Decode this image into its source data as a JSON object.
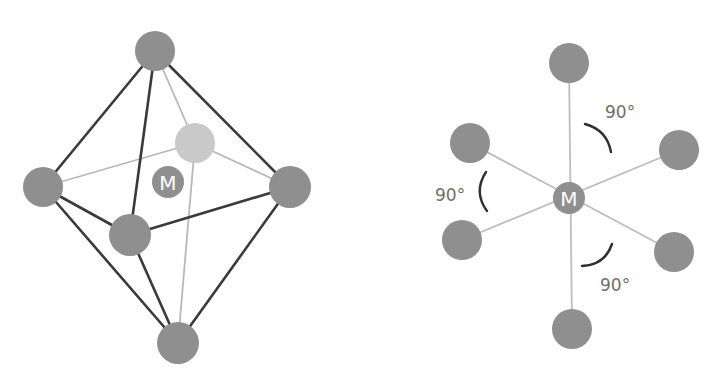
{
  "diagrams": [
    {
      "id": "octahedron-3d",
      "metal_label": "M",
      "ligand_count": 6,
      "atoms": {
        "top": {
          "x": 155,
          "y": 51,
          "r": 20
        },
        "back": {
          "x": 195,
          "y": 143,
          "r": 20
        },
        "left": {
          "x": 43,
          "y": 187,
          "r": 20
        },
        "right": {
          "x": 290,
          "y": 187,
          "r": 21
        },
        "front": {
          "x": 130,
          "y": 235,
          "r": 21
        },
        "bottom": {
          "x": 178,
          "y": 343,
          "r": 21
        }
      },
      "metal": {
        "x": 168,
        "y": 182,
        "r": 16
      }
    },
    {
      "id": "octahedron-bond-angles",
      "metal_label": "M",
      "ligand_count": 6,
      "angle_labels": [
        "90°",
        "90°",
        "90°"
      ],
      "atoms": {
        "top": {
          "x": 569,
          "y": 63,
          "r": 20
        },
        "upper_left": {
          "x": 470,
          "y": 143,
          "r": 20
        },
        "upper_right": {
          "x": 679,
          "y": 150,
          "r": 20
        },
        "lower_left": {
          "x": 462,
          "y": 240,
          "r": 20
        },
        "lower_right": {
          "x": 674,
          "y": 252,
          "r": 20
        },
        "bottom": {
          "x": 572,
          "y": 329,
          "r": 20
        }
      },
      "metal": {
        "x": 569,
        "y": 198,
        "r": 16
      }
    }
  ],
  "colors": {
    "atom": "#8f8f8f",
    "back_atom": "#c9c9c9",
    "front_edge": "#3a3a3a",
    "hidden_edge": "#b8b8b8",
    "angle_arc": "#2e2e2e",
    "angle_text": "#6e6e6e"
  }
}
